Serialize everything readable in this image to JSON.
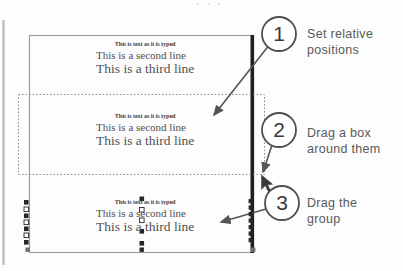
{
  "diagram": {
    "colors": {
      "frame_stroke": "#9a9a9a",
      "selection_dash": "#8f8f8f",
      "handle_fill": "#2b2b2b",
      "text_gray": "#4a4a4a",
      "callout_gray": "#595959",
      "circle_stroke": "#4a4a4a",
      "thick_bar": "#1a1a1a",
      "arrow": "#555555",
      "background": "#ffffff"
    },
    "top_cut_text": ". . .",
    "document_frame": {
      "name": "document-page",
      "x": 29,
      "y": 35,
      "width": 226,
      "height": 218
    },
    "left_margin_rule": {
      "name": "left-margin-rule",
      "x": 3,
      "y": 20,
      "height": 245
    },
    "thick_right_bar": {
      "name": "right-edge-bar",
      "x": 252,
      "y": 35,
      "height": 218
    },
    "selection_box": {
      "name": "marquee-selection-box",
      "x": 18,
      "y": 94,
      "width": 246,
      "height": 80,
      "style": "dotted"
    },
    "text_blocks": [
      {
        "id": "text-block-1",
        "state": "unselected",
        "lines": [
          "This is text as it is typed",
          "This is a second line",
          "This is a third line"
        ]
      },
      {
        "id": "text-block-2",
        "state": "inside-marquee",
        "lines": [
          "This is text as it is typed",
          "This is a second line",
          "This is a third line"
        ]
      },
      {
        "id": "text-block-3",
        "state": "selected-with-handles",
        "lines": [
          "This is text as it is typed",
          "This is a second line",
          "This is a third line"
        ]
      }
    ],
    "callouts": [
      {
        "number": "1",
        "circle": {
          "cx": 279,
          "cy": 34,
          "r": 17
        },
        "label_lines": [
          "Set relative",
          "positions"
        ],
        "leader": {
          "x1": 267,
          "y1": 47,
          "x2": 215,
          "y2": 114
        }
      },
      {
        "number": "2",
        "circle": {
          "cx": 279,
          "cy": 130,
          "r": 17
        },
        "label_lines": [
          "Drag a box",
          "around them"
        ],
        "leader": {
          "x1": 272,
          "y1": 145,
          "x2": 262,
          "y2": 173
        }
      },
      {
        "number": "3",
        "circle": {
          "cx": 282,
          "cy": 203,
          "r": 17
        },
        "label_lines": [
          "Drag the",
          "group"
        ],
        "leader": {
          "x1": 266,
          "y1": 210,
          "x2": 222,
          "y2": 222
        }
      }
    ],
    "cursor": {
      "name": "mouse-pointer",
      "x": 262,
      "y": 175
    },
    "handles": {
      "left_column_x": 26,
      "left_column_ys": [
        202,
        209,
        215,
        221,
        227,
        233,
        240
      ],
      "bar_column_x": 250,
      "bar_column_ys": [
        200,
        207,
        213,
        219,
        226,
        232,
        239
      ],
      "inline": [
        {
          "x": 141,
          "y": 198
        },
        {
          "x": 141,
          "y": 209
        },
        {
          "x": 141,
          "y": 219
        },
        {
          "x": 141,
          "y": 230
        },
        {
          "x": 141,
          "y": 241
        }
      ],
      "frame_corners": [
        {
          "x": 27,
          "y": 249
        },
        {
          "x": 141,
          "y": 249
        },
        {
          "x": 253,
          "y": 249
        }
      ]
    }
  }
}
